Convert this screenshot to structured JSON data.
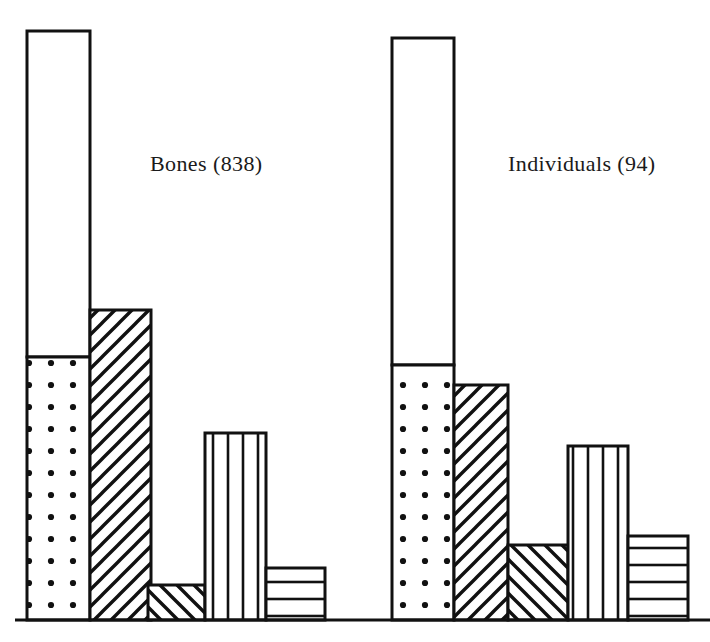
{
  "figure": {
    "width": 710,
    "height": 642,
    "background": "#ffffff",
    "ink_color": "#111111",
    "baseline_y": 620,
    "axis_x_start": 15,
    "axis_x_end": 710
  },
  "labels": {
    "left_group": "Bones (838)",
    "right_group": "Individuals (94)"
  },
  "chart_data": {
    "type": "bar",
    "title": "",
    "subtitle": "",
    "xlabel": "",
    "ylabel": "",
    "grid": false,
    "legend_position": "none",
    "axis": {
      "baseline_only": true,
      "y_tick_labels": [],
      "x_tick_labels": []
    },
    "annotations": [
      "Bones (838)",
      "Individuals (94)"
    ],
    "groups": [
      {
        "name": "Bones",
        "total_label": "Bones (838)",
        "total": 838,
        "bars": [
          {
            "index": 1,
            "pattern": "split-white-over-dots",
            "x": 27,
            "width": 63,
            "top_y": 31,
            "split_y": 357,
            "height": 589,
            "upper_pattern": "white",
            "lower_pattern": "dots",
            "value_fraction_of_max": 1.0
          },
          {
            "index": 2,
            "pattern": "diagonal-hatch-up",
            "x": 90,
            "width": 61,
            "top_y": 310,
            "height": 310,
            "value_fraction_of_max": 0.526
          },
          {
            "index": 3,
            "pattern": "diagonal-hatch-down",
            "x": 148,
            "width": 57,
            "top_y": 585,
            "height": 35,
            "value_fraction_of_max": 0.059
          },
          {
            "index": 4,
            "pattern": "vertical-lines",
            "x": 205,
            "width": 61,
            "top_y": 433,
            "height": 187,
            "value_fraction_of_max": 0.317
          },
          {
            "index": 5,
            "pattern": "horizontal-lines",
            "x": 266,
            "width": 59,
            "top_y": 568,
            "height": 52,
            "value_fraction_of_max": 0.088
          }
        ]
      },
      {
        "name": "Individuals",
        "total_label": "Individuals (94)",
        "total": 94,
        "bars": [
          {
            "index": 1,
            "pattern": "split-white-over-dots",
            "x": 392,
            "width": 62,
            "top_y": 38,
            "split_y": 365,
            "height": 582,
            "upper_pattern": "white",
            "lower_pattern": "dots",
            "value_fraction_of_max": 1.0
          },
          {
            "index": 2,
            "pattern": "diagonal-hatch-up",
            "x": 454,
            "width": 54,
            "top_y": 385,
            "height": 235,
            "value_fraction_of_max": 0.404
          },
          {
            "index": 3,
            "pattern": "diagonal-hatch-down",
            "x": 508,
            "width": 60,
            "top_y": 545,
            "height": 75,
            "value_fraction_of_max": 0.129
          },
          {
            "index": 4,
            "pattern": "vertical-lines",
            "x": 568,
            "width": 60,
            "top_y": 446,
            "height": 174,
            "value_fraction_of_max": 0.299
          },
          {
            "index": 5,
            "pattern": "horizontal-lines",
            "x": 628,
            "width": 60,
            "top_y": 536,
            "height": 84,
            "value_fraction_of_max": 0.144
          }
        ]
      }
    ]
  }
}
